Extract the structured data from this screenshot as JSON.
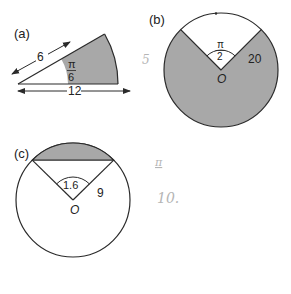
{
  "colors": {
    "shade": "#a8a8a8",
    "line": "#2a2a2a",
    "background": "#ffffff",
    "pencil": "#b5b5b5"
  },
  "figures": [
    {
      "id": "a",
      "label": "(a)",
      "type": "annular-sector",
      "angle_label_num": "π",
      "angle_label_den": "6",
      "inner_length_label": "6",
      "outer_length_label": "12",
      "shaded": "region between radius 6 and radius 12"
    },
    {
      "id": "b",
      "label": "(b)",
      "type": "major-sector",
      "angle_label_num": "π",
      "angle_label_den": "2",
      "radius_label": "20",
      "center_label": "O",
      "shaded": "major sector outside the π/2 angle"
    },
    {
      "id": "c",
      "label": "(c)",
      "type": "minor-segment",
      "angle_label": "1.6",
      "radius_label": "9",
      "center_label": "O",
      "shaded": "segment between chord and arc"
    }
  ],
  "annotations": {
    "pencil_mark_1": "5",
    "pencil_mark_2": "π",
    "pencil_mark_3": "10."
  }
}
